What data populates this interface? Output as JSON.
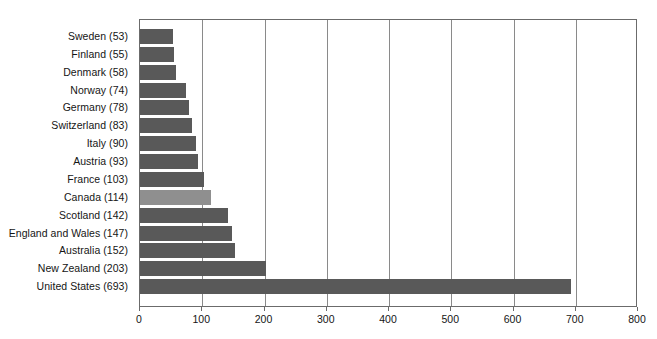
{
  "chart_data": {
    "type": "bar",
    "orientation": "horizontal",
    "title": "",
    "subtitle": "",
    "xlabel": "",
    "ylabel": "",
    "xlim": [
      0,
      800
    ],
    "xticks": [
      "0",
      "100",
      "200",
      "300",
      "400",
      "500",
      "600",
      "700",
      "800"
    ],
    "xtick_values": [
      0,
      100,
      200,
      300,
      400,
      500,
      600,
      700,
      800
    ],
    "grid": true,
    "grid_axis": "x",
    "legend": false,
    "legend_position": "none",
    "categories": [
      "Sweden (53)",
      "Finland (55)",
      "Denmark (58)",
      "Norway (74)",
      "Germany (78)",
      "Switzerland (83)",
      "Italy (90)",
      "Austria (93)",
      "France (103)",
      "Canada (114)",
      "Scotland (142)",
      "England and Wales (147)",
      "Australia (152)",
      "New Zealand (203)",
      "United States (693)"
    ],
    "values": [
      53,
      55,
      58,
      74,
      78,
      83,
      90,
      93,
      103,
      114,
      142,
      147,
      152,
      203,
      693
    ],
    "bars": [
      {
        "label": "Sweden (53)",
        "value": 53,
        "highlight": false
      },
      {
        "label": "Finland (55)",
        "value": 55,
        "highlight": false
      },
      {
        "label": "Denmark (58)",
        "value": 58,
        "highlight": false
      },
      {
        "label": "Norway (74)",
        "value": 74,
        "highlight": false
      },
      {
        "label": "Germany (78)",
        "value": 78,
        "highlight": false
      },
      {
        "label": "Switzerland (83)",
        "value": 83,
        "highlight": false
      },
      {
        "label": "Italy (90)",
        "value": 90,
        "highlight": false
      },
      {
        "label": "Austria (93)",
        "value": 93,
        "highlight": false
      },
      {
        "label": "France (103)",
        "value": 103,
        "highlight": false
      },
      {
        "label": "Canada (114)",
        "value": 114,
        "highlight": true
      },
      {
        "label": "Scotland (142)",
        "value": 142,
        "highlight": false
      },
      {
        "label": "England and Wales (147)",
        "value": 147,
        "highlight": false
      },
      {
        "label": "Australia (152)",
        "value": 152,
        "highlight": false
      },
      {
        "label": "New Zealand (203)",
        "value": 203,
        "highlight": false
      },
      {
        "label": "United States (693)",
        "value": 693,
        "highlight": false
      }
    ]
  },
  "colors": {
    "bar": "#595959",
    "bar_highlight": "#8f8f8f",
    "gridline": "#8a8a8a",
    "axis": "#6b6b6b",
    "text": "#151515",
    "background": "#ffffff"
  }
}
